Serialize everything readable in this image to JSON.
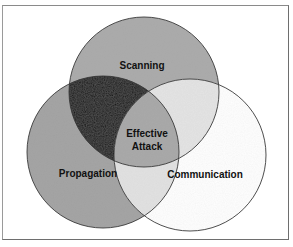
{
  "diagram": {
    "type": "venn",
    "sets": [
      {
        "id": "scanning",
        "label": "Scanning",
        "cx": 144,
        "cy": 92,
        "r": 75,
        "fill": "#a8a8a8"
      },
      {
        "id": "propagation",
        "label": "Propagation",
        "cx": 103,
        "cy": 152,
        "r": 76,
        "fill": "#a0a0a0"
      },
      {
        "id": "communication",
        "label": "Communication",
        "cx": 190,
        "cy": 155,
        "r": 76,
        "fill": "#ffffff"
      }
    ],
    "regions": {
      "scanning_propagation": {
        "fill": "#0c0c0c"
      },
      "scanning_communication": {
        "fill": "#e4e4e4"
      },
      "propagation_communication": {
        "fill": "#e2e2e2"
      },
      "all_three": {
        "fill": "#a6a6a6"
      }
    },
    "center_label_line1": "Effective",
    "center_label_line2": "Attack",
    "stroke_color": "#3a3a3a"
  },
  "labels": {
    "scanning": "Scanning",
    "propagation": "Propagation",
    "communication": "Communication",
    "effective": "Effective",
    "attack": "Attack"
  }
}
